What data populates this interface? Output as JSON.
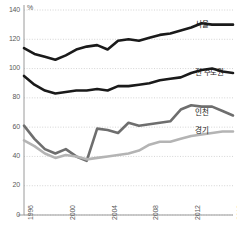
{
  "chart_data": {
    "type": "line",
    "title": "",
    "subtitle": "",
    "xlabel": "",
    "ylabel": "",
    "unit_label": "%",
    "xlim": [
      1996,
      2016
    ],
    "ylim": [
      0,
      140
    ],
    "ytick_values": [
      0,
      20,
      40,
      60,
      80,
      100,
      120,
      140
    ],
    "ytick_labels": [
      "0",
      "20",
      "40",
      "60",
      "80",
      "100",
      "120",
      "140"
    ],
    "xtick_values": [
      1996,
      2000,
      2004,
      2008,
      2012,
      2016
    ],
    "xtick_labels": [
      "1996",
      "2000",
      "2004",
      "2008",
      "2012",
      "2016"
    ],
    "grid": "horizontal-dotted",
    "legend_position": "inline-right-end-labels",
    "x": [
      1996,
      1997,
      1998,
      1999,
      2000,
      2001,
      2002,
      2003,
      2004,
      2005,
      2006,
      2007,
      2008,
      2009,
      2010,
      2011,
      2012,
      2013,
      2014,
      2015,
      2016
    ],
    "series": [
      {
        "name": "서울",
        "label": "서울",
        "color": "#1a1a1a",
        "width": 2.6,
        "values": [
          114,
          110,
          108,
          106,
          109,
          113,
          115,
          116,
          113,
          119,
          120,
          119,
          121,
          123,
          124,
          126,
          128,
          131,
          130,
          130,
          130
        ]
      },
      {
        "name": "전 수도권",
        "label": "전 수도권",
        "color": "#1a1a1a",
        "width": 2.6,
        "values": [
          95,
          89,
          85,
          83,
          84,
          85,
          85,
          86,
          85,
          88,
          88,
          89,
          90,
          92,
          93,
          94,
          97,
          99,
          100,
          98,
          97
        ]
      },
      {
        "name": "인천",
        "label": "인천",
        "color": "#6e6e6e",
        "width": 2.6,
        "values": [
          61,
          52,
          45,
          42,
          45,
          40,
          37,
          59,
          58,
          56,
          63,
          61,
          62,
          63,
          64,
          72,
          75,
          74,
          74,
          71,
          68
        ]
      },
      {
        "name": "경기",
        "label": "경기",
        "color": "#b4b4b4",
        "width": 2.6,
        "values": [
          51,
          47,
          42,
          39,
          41,
          40,
          38,
          39,
          40,
          41,
          42,
          44,
          48,
          50,
          50,
          52,
          54,
          55,
          56,
          57,
          57
        ]
      }
    ]
  }
}
